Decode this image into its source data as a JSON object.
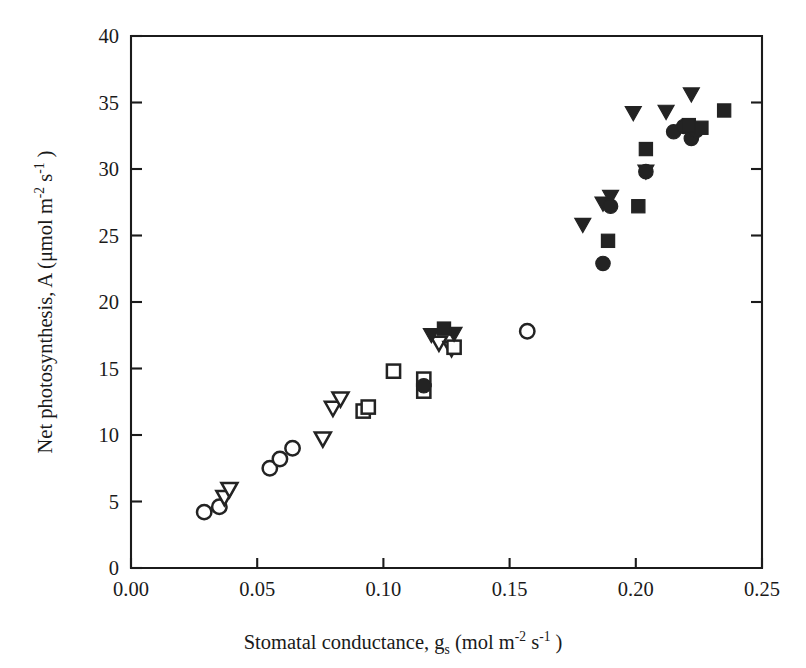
{
  "figure": {
    "background_color": "#ffffff",
    "ink_color": "#232323"
  },
  "axes": {
    "x_label_prefix": "Stomatal conductance, g",
    "x_label_sub": "s",
    "x_label_units_open": " (mol m",
    "x_label_exp1": "-2",
    "x_label_mid": " s",
    "x_label_exp2": "-1",
    "x_label_close": " )",
    "y_label_prefix": "Net photosynthesis, A (",
    "y_label_mu": "μmol m",
    "y_label_exp1": "-2",
    "y_label_mid": " s",
    "y_label_exp2": "-1",
    "y_label_close": " )",
    "x_ticks": [
      "0.00",
      "0.05",
      "0.10",
      "0.15",
      "0.20",
      "0.25"
    ],
    "y_ticks": [
      "0",
      "5",
      "10",
      "15",
      "20",
      "25",
      "30",
      "35",
      "40"
    ]
  },
  "chart_data": {
    "type": "scatter",
    "title": "",
    "xlabel": "Stomatal conductance, g_s (mol m-2 s-1)",
    "ylabel": "Net photosynthesis, A (umol m-2 s-1)",
    "xlim": [
      0.0,
      0.25
    ],
    "ylim": [
      0,
      40
    ],
    "x_tick_values": [
      0.0,
      0.05,
      0.1,
      0.15,
      0.2,
      0.25
    ],
    "y_tick_values": [
      0,
      5,
      10,
      15,
      20,
      25,
      30,
      35,
      40
    ],
    "grid": false,
    "legend": "none",
    "frame": "box",
    "tick_direction": "in",
    "series": [
      {
        "name": "open-circle",
        "marker": "circle",
        "fill": "open",
        "points": [
          [
            0.029,
            4.2
          ],
          [
            0.035,
            4.6
          ],
          [
            0.055,
            7.5
          ],
          [
            0.059,
            8.2
          ],
          [
            0.064,
            9.0
          ],
          [
            0.157,
            17.8
          ]
        ]
      },
      {
        "name": "open-triangle-down",
        "marker": "triangle-down",
        "fill": "open",
        "points": [
          [
            0.037,
            5.3
          ],
          [
            0.039,
            5.9
          ],
          [
            0.076,
            9.7
          ],
          [
            0.08,
            12.0
          ],
          [
            0.083,
            12.7
          ],
          [
            0.122,
            16.9
          ],
          [
            0.127,
            16.5
          ]
        ]
      },
      {
        "name": "open-square",
        "marker": "square",
        "fill": "open",
        "points": [
          [
            0.092,
            11.8
          ],
          [
            0.094,
            12.1
          ],
          [
            0.104,
            14.8
          ],
          [
            0.116,
            13.3
          ],
          [
            0.116,
            14.2
          ],
          [
            0.128,
            16.6
          ]
        ]
      },
      {
        "name": "filled-triangle-down",
        "marker": "triangle-down",
        "fill": "filled",
        "points": [
          [
            0.119,
            17.5
          ],
          [
            0.128,
            17.6
          ],
          [
            0.179,
            25.8
          ],
          [
            0.187,
            27.4
          ],
          [
            0.19,
            27.9
          ],
          [
            0.199,
            34.2
          ],
          [
            0.204,
            29.8
          ],
          [
            0.212,
            34.3
          ],
          [
            0.222,
            35.6
          ]
        ]
      },
      {
        "name": "filled-circle",
        "marker": "circle",
        "fill": "filled",
        "points": [
          [
            0.116,
            13.7
          ],
          [
            0.187,
            22.9
          ],
          [
            0.19,
            27.2
          ],
          [
            0.204,
            29.8
          ],
          [
            0.215,
            32.8
          ],
          [
            0.219,
            33.2
          ],
          [
            0.222,
            32.3
          ],
          [
            0.224,
            32.9
          ]
        ]
      },
      {
        "name": "filled-square",
        "marker": "square",
        "fill": "filled",
        "points": [
          [
            0.124,
            18.0
          ],
          [
            0.189,
            24.6
          ],
          [
            0.201,
            27.2
          ],
          [
            0.204,
            31.5
          ],
          [
            0.221,
            33.3
          ],
          [
            0.226,
            33.1
          ],
          [
            0.235,
            34.4
          ]
        ]
      }
    ]
  }
}
